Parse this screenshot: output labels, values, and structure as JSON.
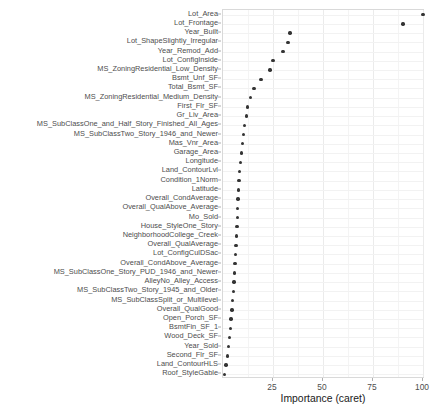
{
  "chart_data": {
    "type": "scatter",
    "title": "",
    "xlabel": "Importance (caret)",
    "ylabel": "",
    "xlim": [
      0,
      101
    ],
    "xticks": [
      25,
      50,
      75,
      100
    ],
    "xticklabels": [
      "25",
      "50",
      "75",
      "100"
    ],
    "grid": true,
    "legend": "none",
    "orientation": "horizontal-dotplot",
    "categories": [
      "Lot_Area",
      "Lot_Frontage",
      "Year_Built",
      "Lot_ShapeSlightly_Irregular",
      "Year_Remod_Add",
      "Lot_ConfigInside",
      "MS_ZoningResidential_Low_Density",
      "Bsmt_Unf_SF",
      "Total_Bsmt_SF",
      "MS_ZoningResidential_Medium_Density",
      "First_Flr_SF",
      "Gr_Liv_Area",
      "MS_SubClassOne_and_Half_Story_Finished_All_Ages",
      "MS_SubClassTwo_Story_1946_and_Newer",
      "Mas_Vnr_Area",
      "Garage_Area",
      "Longitude",
      "Land_ContourLvl",
      "Condition_1Norm",
      "Latitude",
      "Overall_CondAverage",
      "Overall_QualAbove_Average",
      "Mo_Sold",
      "House_StyleOne_Story",
      "NeighborhoodCollege_Creek",
      "Overall_QualAverage",
      "Lot_ConfigCulDSac",
      "Overall_CondAbove_Average",
      "MS_SubClassOne_Story_PUD_1946_and_Newer",
      "AlleyNo_Alley_Access",
      "MS_SubClassTwo_Story_1945_and_Older",
      "MS_SubClassSplit_or_Multilevel",
      "Overall_QualGood",
      "Open_Porch_SF",
      "BsmtFin_SF_1",
      "Wood_Deck_SF",
      "Year_Sold",
      "Second_Flr_SF",
      "Land_ContourHLS",
      "Roof_StyleGable"
    ],
    "values": [
      100.0,
      90.0,
      33.5,
      32.5,
      30.0,
      24.9,
      23.4,
      18.9,
      15.4,
      13.6,
      12.3,
      11.6,
      10.6,
      10.1,
      9.6,
      9.1,
      8.6,
      8.3,
      8.0,
      7.8,
      7.5,
      7.3,
      7.1,
      6.9,
      6.7,
      6.4,
      6.2,
      6.0,
      5.7,
      5.4,
      5.1,
      4.8,
      4.4,
      4.0,
      3.6,
      3.2,
      2.7,
      2.1,
      1.4,
      0.6
    ]
  },
  "colors": {
    "point": "#333333",
    "grid_major": "#ebebeb",
    "grid_minor": "#f4f4f4",
    "panel_border": "#d9d9d9",
    "axis_text": "#4d4d4d",
    "title_text": "#1a1a1a"
  }
}
